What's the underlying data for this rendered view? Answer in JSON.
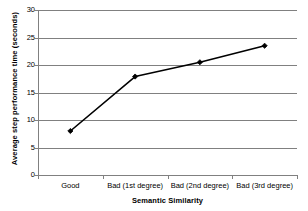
{
  "chart_data": {
    "type": "line",
    "title": "",
    "xlabel": "Semantic Similarity",
    "ylabel": "Average step performance time (seconds)",
    "categories": [
      "Good",
      "Bad (1st degree)",
      "Bad (2nd degree)",
      "Bad (3rd degree)"
    ],
    "values": [
      8.0,
      17.9,
      20.5,
      23.5
    ],
    "series": [
      {
        "name": "Average step performance time",
        "values": [
          8.0,
          17.9,
          20.5,
          23.5
        ]
      }
    ],
    "ylim": [
      0,
      30
    ],
    "y_ticks": [
      0,
      5,
      10,
      15,
      20,
      25,
      30
    ],
    "y_tick_labels": [
      "0",
      "5",
      "10",
      "15",
      "20",
      "25",
      "30"
    ],
    "grid": true,
    "grid_axis": "y",
    "legend": false,
    "legend_position": "none",
    "marker": "diamond",
    "line_color": "#000000",
    "marker_color": "#000000",
    "grid_color": "#808080",
    "plot_background": "#ffffff"
  }
}
